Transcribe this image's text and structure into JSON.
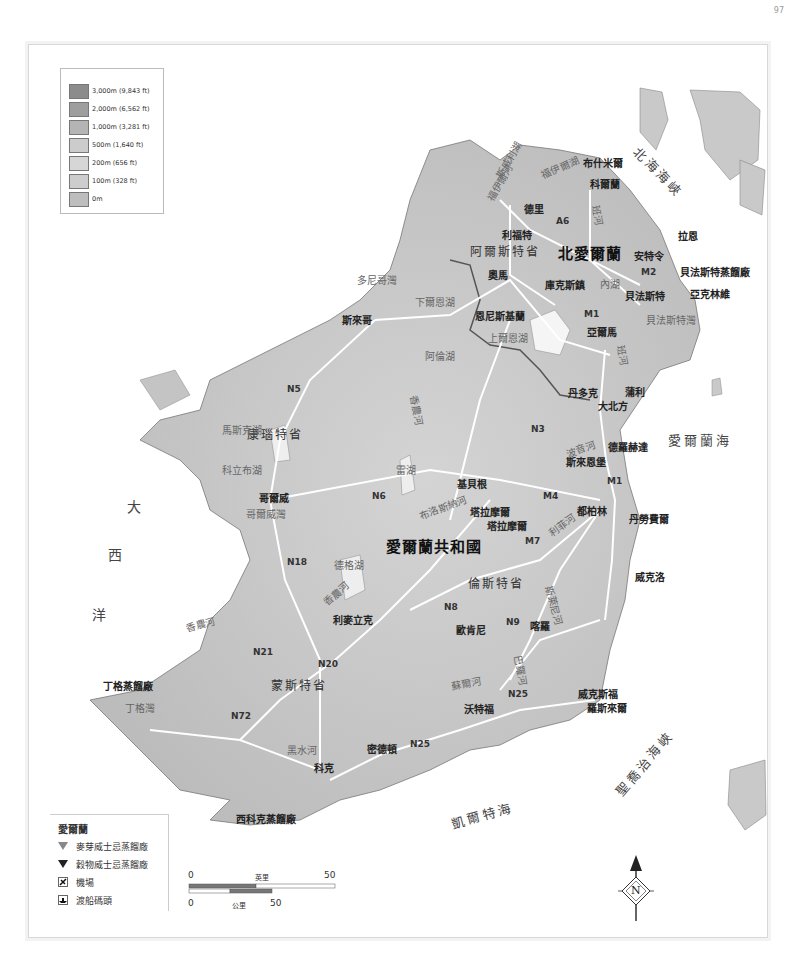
{
  "page_number": "97",
  "elevation_legend": {
    "items": [
      {
        "label": "3,000m (9,843 ft)",
        "color": "#8c8c8c"
      },
      {
        "label": "2,000m (6,562 ft)",
        "color": "#9e9e9e"
      },
      {
        "label": "1,000m (3,281 ft)",
        "color": "#b4b4b4"
      },
      {
        "label": "500m (1,640 ft)",
        "color": "#cccccc"
      },
      {
        "label": "200m (656 ft)",
        "color": "#d6d6d6"
      },
      {
        "label": "100m (328 ft)",
        "color": "#cdcdcd"
      },
      {
        "label": "0m",
        "color": "#bdbdbd"
      }
    ]
  },
  "symbol_legend": {
    "title": "愛爾蘭",
    "items": [
      {
        "icon": "malt-whiskey-distillery-icon",
        "label": "麥芽威士忌蒸餾廠"
      },
      {
        "icon": "grain-whiskey-distillery-icon",
        "label": "穀物威士忌蒸餾廠"
      },
      {
        "icon": "airport-icon",
        "label": "機場"
      },
      {
        "icon": "ferry-port-icon",
        "label": "渡船碼頭"
      }
    ]
  },
  "scale_bar": {
    "miles_label": "英里",
    "miles_start": "0",
    "miles_end": "50",
    "km_label": "公里",
    "km_start": "0",
    "km_end": "50"
  },
  "compass": {
    "label": "N"
  },
  "countries": {
    "ni": "北愛爾蘭",
    "roi": "愛爾蘭共和國"
  },
  "regions": {
    "ulster_antrim": "阿爾斯特省",
    "connacht": "康瑙特省",
    "leinster": "倫斯特省",
    "munster": "蒙斯特省"
  },
  "seas": {
    "north_channel": "北海海峽",
    "irish_sea": "愛爾蘭海",
    "st_georges": "聖喬治海峽",
    "celtic_sea": "凱爾特海",
    "atlantic": [
      "大",
      "西",
      "洋"
    ]
  },
  "cities": {
    "bushmills": "布什米爾",
    "coleraine": "科爾蘭",
    "derry": "德里",
    "larne": "拉恩",
    "lifford": "利福特",
    "antrim": "安特令",
    "belfast_distillery": "貝法斯特蒸餾廠",
    "belfast": "貝法斯特",
    "armagh_whiskey": "亞克林維",
    "omagh": "奧馬",
    "cookstown": "庫克斯鎮",
    "armagh": "亞爾馬",
    "enniskillen": "恩尼斯基蘭",
    "sligo": "斯來哥",
    "newry": "蒲利",
    "dundalk": "丹多克",
    "dunkirk": "大北方",
    "drogheda": "德羅赫達",
    "slane": "斯來恩堡",
    "kilbeggan": "基貝根",
    "tullamore": "塔拉摩爾",
    "tullamore_distillery": "塔拉摩爾",
    "dublin": "都柏林",
    "dun_laoghaire": "丹勞費爾",
    "galway": "哥爾威",
    "wicklow": "威克洛",
    "limerick": "利麥立克",
    "kilkenny": "歐肯尼",
    "carlow": "喀羅",
    "wexford": "威克斯福",
    "rosslare": "羅斯來爾",
    "waterford": "沃特福",
    "midleton": "密德頓",
    "cork": "科克",
    "dingle": "丁格蒸餾廠",
    "west_cork": "西科克蒸餾廠"
  },
  "waters": {
    "donegal_bay": "多尼哥灣",
    "lough_erne": "下爾恩湖",
    "upper_erne": "上爾恩湖",
    "lough_allen": "阿倫湖",
    "lough_neagh": "內湖",
    "belfast_lough": "貝法斯特灣",
    "lough_mask": "馬斯克湖",
    "lough_corrib": "科立布湖",
    "galway_bay": "哥爾威灣",
    "lough_ree": "雷湖",
    "lough_derg": "德格湖",
    "shannon": "香農河",
    "shannon_estuary": "香農河",
    "boyne": "波音河",
    "liffey": "利菲河",
    "barrow": "巴羅河",
    "slaney": "斯萊尼河",
    "suir": "蘇爾河",
    "blackwater": "黑水河",
    "dingle_bay": "丁格灣",
    "bann": "班河",
    "foyle": "福伊爾河",
    "lough_swilly": "斯威利湖",
    "lough_foyle": "福伊爾湖",
    "brosna": "布洛斯納河",
    "shannon_n": "香農河",
    "bann_s": "班河"
  },
  "roads": [
    "A6",
    "M2",
    "M1",
    "N5",
    "N3",
    "M1",
    "M4",
    "M7",
    "N6",
    "N18",
    "N8",
    "N9",
    "N21",
    "N20",
    "N72",
    "N25",
    "N25"
  ]
}
